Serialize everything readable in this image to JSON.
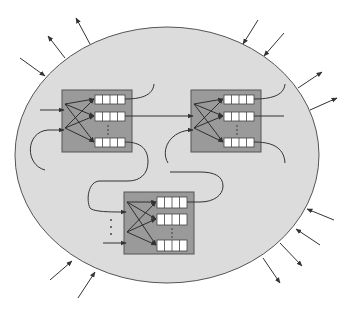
{
  "diagram": {
    "type": "network-of-queueing-nodes",
    "colors": {
      "background": "#ffffff",
      "ellipse_fill": "#dcdcdc",
      "ellipse_stroke": "#555555",
      "node_fill": "#9a9a9a",
      "node_stroke": "#555555",
      "queue_cell_fill": "#ffffff",
      "line": "#333333"
    },
    "nodes": [
      {
        "id": "node-top-left",
        "x": 62,
        "y": 90,
        "w": 70,
        "h": 62,
        "queues": 3
      },
      {
        "id": "node-top-right",
        "x": 191,
        "y": 90,
        "w": 70,
        "h": 62,
        "queues": 3
      },
      {
        "id": "node-bottom",
        "x": 124,
        "y": 192,
        "w": 70,
        "h": 62,
        "queues": 3
      }
    ],
    "external_arrows": {
      "incoming": 6,
      "outgoing": 6
    }
  }
}
